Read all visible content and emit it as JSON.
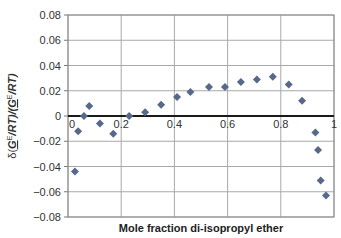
{
  "chart_data": {
    "type": "scatter",
    "title": "",
    "xlabel": "Mole fraction di-isopropyl ether",
    "ylabel": "δ(G^E/RT)/(G^E/RT)",
    "xlim": [
      0,
      1
    ],
    "ylim": [
      -0.08,
      0.08
    ],
    "x_ticks": [
      "0",
      "0.2",
      "0.4",
      "0.6",
      "0.8",
      "1"
    ],
    "y_ticks": [
      "0.08",
      "0.06",
      "0.04",
      "0.02",
      "0",
      "−0.02",
      "−0.04",
      "−0.06",
      "−0.08"
    ],
    "grid": true,
    "legend": null,
    "marker": "diamond",
    "marker_color": "#56698a",
    "series": [
      {
        "name": "data",
        "x": [
          0.026,
          0.038,
          0.06,
          0.08,
          0.12,
          0.17,
          0.23,
          0.29,
          0.35,
          0.41,
          0.46,
          0.53,
          0.59,
          0.65,
          0.71,
          0.77,
          0.83,
          0.88,
          0.93,
          0.94,
          0.95,
          0.97
        ],
        "y": [
          -0.044,
          -0.012,
          0.0,
          0.008,
          -0.006,
          -0.014,
          0.0,
          0.003,
          0.009,
          0.015,
          0.019,
          0.023,
          0.023,
          0.027,
          0.029,
          0.031,
          0.025,
          0.012,
          -0.013,
          -0.027,
          -0.051,
          -0.063
        ]
      }
    ]
  },
  "labels": {
    "xlabel": "Mole fraction di-isopropyl ether",
    "ylabel_prefix": "δ(",
    "ylabel_g": "G",
    "ylabel_e": "E",
    "ylabel_rt": "/RT)/(",
    "ylabel_g2": "G",
    "ylabel_e2": "E",
    "ylabel_rt2": "/RT)"
  }
}
